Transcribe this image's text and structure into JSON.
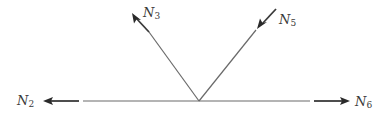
{
  "diagram": {
    "type": "free-body-diagram",
    "colors": {
      "line": "#6a6a6a",
      "arrow": "#3a3a3a",
      "label": "#3a3a3a",
      "background": "#ffffff"
    },
    "joint": {
      "x": 199,
      "y": 101
    },
    "forces": [
      {
        "id": "N2",
        "symbol": "N",
        "subscript": "2",
        "direction": "left",
        "sense": "away-from-joint"
      },
      {
        "id": "N3",
        "symbol": "N",
        "subscript": "3",
        "direction": "up-left",
        "sense": "away-from-joint"
      },
      {
        "id": "N5",
        "symbol": "N",
        "subscript": "5",
        "direction": "down-left",
        "sense": "toward-joint"
      },
      {
        "id": "N6",
        "symbol": "N",
        "subscript": "6",
        "direction": "right",
        "sense": "away-from-joint"
      }
    ]
  }
}
